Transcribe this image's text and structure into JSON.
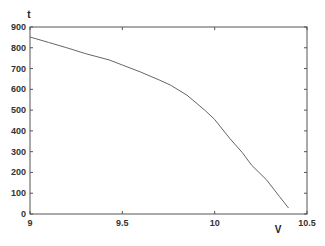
{
  "chart_data": {
    "type": "line",
    "title": "",
    "xlabel": "V",
    "ylabel": "t",
    "xlim": [
      9,
      10.5
    ],
    "ylim": [
      0,
      900
    ],
    "xticks": [
      9,
      9.5,
      10,
      10.5
    ],
    "xtick_labels": [
      "9",
      "9.5",
      "10",
      "10.5"
    ],
    "yticks": [
      0,
      100,
      200,
      300,
      400,
      500,
      600,
      700,
      800,
      900
    ],
    "ytick_labels": [
      "0",
      "100",
      "200",
      "300",
      "400",
      "500",
      "600",
      "700",
      "800",
      "900"
    ],
    "grid": false,
    "legend": null,
    "series": [
      {
        "name": "t(V)",
        "color": "#666666",
        "x": [
          9.0,
          9.1,
          9.2,
          9.3,
          9.43,
          9.5,
          9.6,
          9.7,
          9.76,
          9.85,
          9.95,
          10.0,
          10.08,
          10.15,
          10.2,
          10.28,
          10.35,
          10.4
        ],
        "y": [
          852,
          826,
          800,
          772,
          741,
          717,
          683,
          645,
          621,
          572,
          497,
          455,
          366,
          295,
          235,
          165,
          85,
          29
        ]
      }
    ]
  },
  "layout": {
    "plot_left": 30,
    "plot_right": 307,
    "plot_top": 27,
    "plot_bottom": 214,
    "axis_color": "#555555"
  }
}
